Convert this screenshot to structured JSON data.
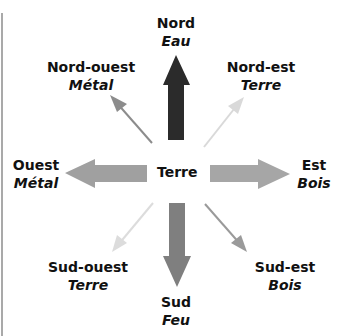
{
  "diagram": {
    "center": {
      "label": "Terre"
    },
    "directions": [
      {
        "id": "nord",
        "direction": "Nord",
        "element": "Eau",
        "arrow_color": "#2b2b2b",
        "arrow_style": "thick"
      },
      {
        "id": "nord-est",
        "direction": "Nord-est",
        "element": "Terre",
        "arrow_color": "#d9d9d9",
        "arrow_style": "thin"
      },
      {
        "id": "est",
        "direction": "Est",
        "element": "Bois",
        "arrow_color": "#a6a6a6",
        "arrow_style": "thick"
      },
      {
        "id": "sud-est",
        "direction": "Sud-est",
        "element": "Bois",
        "arrow_color": "#9a9a9a",
        "arrow_style": "thin"
      },
      {
        "id": "sud",
        "direction": "Sud",
        "element": "Feu",
        "arrow_color": "#7f7f7f",
        "arrow_style": "thick"
      },
      {
        "id": "sud-ouest",
        "direction": "Sud-ouest",
        "element": "Terre",
        "arrow_color": "#dcdcdc",
        "arrow_style": "thin"
      },
      {
        "id": "ouest",
        "direction": "Ouest",
        "element": "Métal",
        "arrow_color": "#a0a0a0",
        "arrow_style": "thick"
      },
      {
        "id": "nord-ouest",
        "direction": "Nord-ouest",
        "element": "Métal",
        "arrow_color": "#8c8c8c",
        "arrow_style": "thin"
      }
    ]
  }
}
